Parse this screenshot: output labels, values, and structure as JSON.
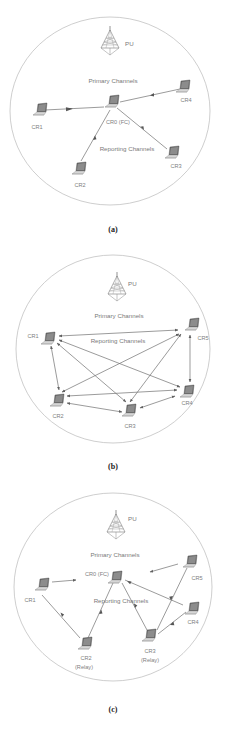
{
  "figure": {
    "colors": {
      "ring": "#b9b9b9",
      "link": "#707070",
      "label": "#7a7a7a",
      "caption": "#222222",
      "laptop": "#555555"
    },
    "panels": [
      {
        "id": "a",
        "caption": "(a)",
        "pu_label": "PU",
        "primary_label": "Primary Channels",
        "reporting_label": "Reporting Channels",
        "topology": "centralized",
        "nodes": [
          {
            "id": "CR0",
            "label": "CR0 (FC)",
            "role": "fusion-center"
          },
          {
            "id": "CR1",
            "label": "CR1"
          },
          {
            "id": "CR2",
            "label": "CR2"
          },
          {
            "id": "CR3",
            "label": "CR3"
          },
          {
            "id": "CR4",
            "label": "CR4"
          }
        ],
        "edges": [
          {
            "from": "CR1",
            "to": "CR0",
            "direction": "one-way"
          },
          {
            "from": "CR2",
            "to": "CR0",
            "direction": "one-way"
          },
          {
            "from": "CR3",
            "to": "CR0",
            "direction": "one-way"
          },
          {
            "from": "CR4",
            "to": "CR0",
            "direction": "one-way"
          }
        ]
      },
      {
        "id": "b",
        "caption": "(b)",
        "pu_label": "PU",
        "primary_label": "Primary Channels",
        "reporting_label": "Reporting Channels",
        "topology": "distributed",
        "nodes": [
          {
            "id": "CR1",
            "label": "CR1"
          },
          {
            "id": "CR2",
            "label": "CR2"
          },
          {
            "id": "CR3",
            "label": "CR3"
          },
          {
            "id": "CR4",
            "label": "CR4"
          },
          {
            "id": "CR5",
            "label": "CR5"
          }
        ],
        "edges": [
          {
            "from": "CR1",
            "to": "CR5",
            "direction": "two-way"
          },
          {
            "from": "CR1",
            "to": "CR2",
            "direction": "two-way"
          },
          {
            "from": "CR1",
            "to": "CR3",
            "direction": "two-way"
          },
          {
            "from": "CR1",
            "to": "CR4",
            "direction": "two-way"
          },
          {
            "from": "CR2",
            "to": "CR5",
            "direction": "two-way"
          },
          {
            "from": "CR2",
            "to": "CR3",
            "direction": "two-way"
          },
          {
            "from": "CR2",
            "to": "CR4",
            "direction": "two-way"
          },
          {
            "from": "CR3",
            "to": "CR5",
            "direction": "two-way"
          },
          {
            "from": "CR3",
            "to": "CR4",
            "direction": "two-way"
          },
          {
            "from": "CR4",
            "to": "CR5",
            "direction": "two-way"
          }
        ]
      },
      {
        "id": "c",
        "caption": "(c)",
        "pu_label": "PU",
        "primary_label": "Primary Channels",
        "reporting_label": "Reporting Channels",
        "topology": "relay-assisted",
        "nodes": [
          {
            "id": "CR0",
            "label": "CR0 (FC)",
            "role": "fusion-center"
          },
          {
            "id": "CR1",
            "label": "CR1"
          },
          {
            "id": "CR2",
            "label": "CR2",
            "sublabel": "(Relay)"
          },
          {
            "id": "CR3",
            "label": "CR3",
            "sublabel": "(Relay)"
          },
          {
            "id": "CR4",
            "label": "CR4"
          },
          {
            "id": "CR5",
            "label": "CR5"
          }
        ],
        "edges": [
          {
            "from": "CR1",
            "to": "CR0",
            "direction": "one-way",
            "note": "partial"
          },
          {
            "from": "CR1",
            "to": "CR2",
            "direction": "one-way"
          },
          {
            "from": "CR2",
            "to": "CR0",
            "direction": "one-way"
          },
          {
            "from": "CR5",
            "to": "CR0",
            "direction": "one-way",
            "note": "partial"
          },
          {
            "from": "CR5",
            "to": "CR3",
            "direction": "one-way"
          },
          {
            "from": "CR4",
            "to": "CR0",
            "direction": "one-way"
          },
          {
            "from": "CR4",
            "to": "CR3",
            "direction": "one-way"
          },
          {
            "from": "CR3",
            "to": "CR0",
            "direction": "one-way"
          }
        ]
      }
    ]
  }
}
